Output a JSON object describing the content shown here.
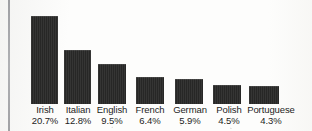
{
  "chart_data": {
    "type": "bar",
    "title": "",
    "xlabel": "",
    "ylabel": "",
    "grid": false,
    "legend": "none",
    "ylim": [
      0,
      22
    ],
    "categories": [
      "Irish",
      "Italian",
      "English",
      "French",
      "German",
      "Polish",
      "Portuguese"
    ],
    "values": [
      20.7,
      12.8,
      9.5,
      6.4,
      5.9,
      4.5,
      4.3
    ],
    "value_labels": [
      "20.7%",
      "12.8%",
      "9.5%",
      "6.4%",
      "5.9%",
      "4.5%",
      "4.3%"
    ],
    "bar_color": "#272726",
    "background_color": "#fdfdfc"
  },
  "bars": [
    {
      "name": "Irish",
      "value": "20.7%",
      "pct": 20.7
    },
    {
      "name": "Italian",
      "value": "12.8%",
      "pct": 12.8
    },
    {
      "name": "English",
      "value": "9.5%",
      "pct": 9.5
    },
    {
      "name": "French",
      "value": "6.4%",
      "pct": 6.4
    },
    {
      "name": "German",
      "value": "5.9%",
      "pct": 5.9
    },
    {
      "name": "Polish",
      "value": "4.5%",
      "pct": 4.5
    },
    {
      "name": "Portuguese",
      "value": "4.3%",
      "pct": 4.3
    }
  ]
}
